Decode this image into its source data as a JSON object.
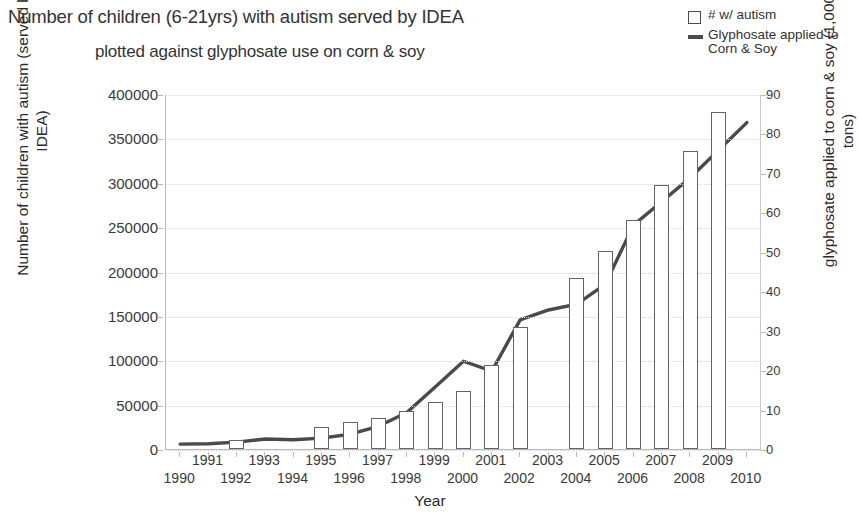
{
  "title": {
    "line1": "Number of children (6-21yrs) with autism served by IDEA",
    "line2": "plotted against glyphosate use on corn & soy"
  },
  "legend": {
    "position": "top-right",
    "items": [
      {
        "marker": "box-outline",
        "label": "# w/ autism"
      },
      {
        "marker": "line",
        "label": "Glyphosate applied to Corn & Soy"
      }
    ]
  },
  "axes": {
    "x": {
      "title": "Year",
      "ticks": [
        "1990",
        "1991",
        "1992",
        "1993",
        "1994",
        "1995",
        "1996",
        "1997",
        "1998",
        "1999",
        "2000",
        "2001",
        "2002",
        "2003",
        "2004",
        "2005",
        "2006",
        "2007",
        "2008",
        "2009",
        "2010"
      ]
    },
    "y_left": {
      "title": "Number of children with autism (served by IDEA)",
      "ticks": [
        "0",
        "50000",
        "100000",
        "150000",
        "200000",
        "250000",
        "300000",
        "350000",
        "400000"
      ]
    },
    "y_right": {
      "title": "glyphosate applied to corn & soy (1,000 tons)",
      "ticks": [
        "0",
        "10",
        "20",
        "30",
        "40",
        "50",
        "60",
        "70",
        "80",
        "90"
      ]
    }
  },
  "colors": {
    "line": "#4a4a4a",
    "bar_stroke": "#636363",
    "bar_fill": "#ffffff",
    "grid": "#d6d6d6",
    "axis": "#b9b9b9",
    "text": "#2b2b2b"
  },
  "chart_data": {
    "type": "bar",
    "title": "Number of children (6-21yrs) with autism served by IDEA plotted against glyphosate use on corn & soy",
    "xlabel": "Year",
    "ylabel": "Number of children with autism (served by IDEA)",
    "y2label": "glyphosate applied to corn & soy (1,000 tons)",
    "grid": true,
    "legend_position": "top-right",
    "categories": [
      1990,
      1991,
      1992,
      1993,
      1994,
      1995,
      1996,
      1997,
      1998,
      1999,
      2000,
      2001,
      2002,
      2003,
      2004,
      2005,
      2006,
      2007,
      2008,
      2009,
      2010
    ],
    "ylim": [
      0,
      400000
    ],
    "y2lim": [
      0,
      90
    ],
    "series": [
      {
        "name": "# w/ autism",
        "type": "bar",
        "axis": "left",
        "values": [
          null,
          null,
          10000,
          null,
          null,
          25000,
          30000,
          35000,
          43000,
          53000,
          65000,
          95000,
          137000,
          null,
          193000,
          223000,
          258000,
          297000,
          336000,
          380000,
          null
        ]
      },
      {
        "name": "Glyphosate applied to Corn & Soy",
        "type": "line",
        "axis": "right",
        "values": [
          1.5,
          1.6,
          2.0,
          2.8,
          2.6,
          3.0,
          4.0,
          6.0,
          9.5,
          16.0,
          22.5,
          20.0,
          33.0,
          35.5,
          37.0,
          42.0,
          57.0,
          63.0,
          69.0,
          76.0,
          83.0
        ]
      }
    ]
  }
}
